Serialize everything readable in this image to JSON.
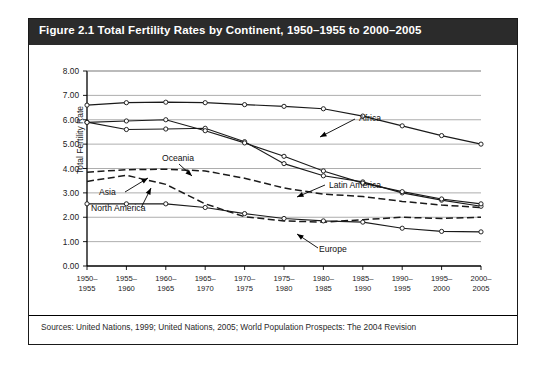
{
  "figure": {
    "title": "Figure 2.1 Total Fertility Rates by Continent, 1950–1955 to 2000–2005",
    "source": "Sources: United Nations, 1999; United Nations, 2005; World Population Prospects: The 2004 Revision"
  },
  "chart_data": {
    "type": "line",
    "title": "Figure 2.1 Total Fertility Rates by Continent, 1950–1955 to 2000–2005",
    "xlabel": "",
    "ylabel": "Total Fertility Rate",
    "ylim": [
      0.0,
      8.0
    ],
    "ytick_step": 1.0,
    "ytick_labels": [
      "0.00",
      "1.00",
      "2.00",
      "3.00",
      "4.00",
      "5.00",
      "6.00",
      "7.00",
      "8.00"
    ],
    "grid": true,
    "legend": "inline-annotations",
    "categories": [
      "1950–1955",
      "1955–1960",
      "1960–1965",
      "1965–1970",
      "1970–1975",
      "1975–1980",
      "1980–1985",
      "1985–1990",
      "1990–1995",
      "1995–2000",
      "2000–2005"
    ],
    "series": [
      {
        "name": "Africa",
        "style": "solid-markers",
        "values": [
          6.6,
          6.7,
          6.72,
          6.7,
          6.62,
          6.55,
          6.45,
          6.15,
          5.75,
          5.35,
          5.0
        ]
      },
      {
        "name": "Asia",
        "style": "solid-markers",
        "values": [
          5.9,
          5.6,
          5.62,
          5.65,
          5.1,
          4.2,
          3.7,
          3.45,
          3.0,
          2.7,
          2.45
        ]
      },
      {
        "name": "Latin America",
        "style": "solid-markers",
        "values": [
          5.89,
          5.95,
          6.0,
          5.55,
          5.05,
          4.5,
          3.9,
          3.4,
          3.05,
          2.75,
          2.55
        ]
      },
      {
        "name": "Oceania",
        "style": "dashed",
        "values": [
          3.85,
          3.95,
          3.97,
          3.9,
          3.6,
          3.2,
          2.95,
          2.85,
          2.65,
          2.5,
          2.4
        ]
      },
      {
        "name": "North America",
        "style": "dashed",
        "values": [
          3.47,
          3.72,
          3.35,
          2.55,
          2.02,
          1.85,
          1.8,
          1.9,
          2.0,
          1.95,
          2.0
        ]
      },
      {
        "name": "Europe",
        "style": "solid-markers",
        "values": [
          2.55,
          2.55,
          2.55,
          2.4,
          2.15,
          1.95,
          1.85,
          1.8,
          1.55,
          1.42,
          1.4
        ]
      }
    ],
    "annotations": [
      {
        "label": "Africa"
      },
      {
        "label": "Asia"
      },
      {
        "label": "Latin America"
      },
      {
        "label": "Oceania"
      },
      {
        "label": "North America"
      },
      {
        "label": "Europe"
      }
    ]
  }
}
